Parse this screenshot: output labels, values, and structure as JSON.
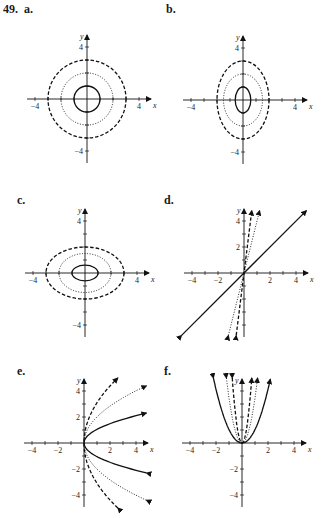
{
  "problem_number": "49.",
  "panels": [
    {
      "id": "a",
      "label": "a.",
      "origin": [
        87,
        99
      ],
      "unit": 13,
      "type": "circles"
    },
    {
      "id": "b",
      "label": "b.",
      "origin": [
        243,
        100
      ],
      "unit": 13,
      "type": "vertical-ellipses"
    },
    {
      "id": "c",
      "label": "c.",
      "origin": [
        85,
        273
      ],
      "unit": 13,
      "type": "horizontal-ellipses"
    },
    {
      "id": "d",
      "label": "d.",
      "origin": [
        244,
        273
      ],
      "unit": 13,
      "type": "lines"
    },
    {
      "id": "e",
      "label": "e.",
      "origin": [
        84,
        443
      ],
      "unit": 13,
      "type": "sideways-parabolas"
    },
    {
      "id": "f",
      "label": "f.",
      "origin": [
        242,
        443
      ],
      "unit": 13,
      "type": "upward-parabolas"
    }
  ],
  "axis": {
    "x_label": "x",
    "y_label": "y"
  },
  "chart_data": [
    {
      "panel": "a",
      "type": "line",
      "title": "a.",
      "xlabel": "x",
      "ylabel": "y",
      "xticks": [
        -4,
        4
      ],
      "yticks": [
        4,
        -4
      ],
      "xlim": [
        -5,
        5
      ],
      "ylim": [
        -5,
        5
      ],
      "series": [
        {
          "name": "solid circle",
          "style": "solid",
          "shape": "circle",
          "center": [
            0,
            0
          ],
          "radius": 1
        },
        {
          "name": "dotted circle",
          "style": "dotted",
          "shape": "circle",
          "center": [
            0,
            0
          ],
          "radius": 2
        },
        {
          "name": "dashed circle",
          "style": "dashed",
          "shape": "circle",
          "center": [
            0,
            0
          ],
          "radius": 3
        }
      ]
    },
    {
      "panel": "b",
      "type": "line",
      "title": "b.",
      "xlabel": "x",
      "ylabel": "y",
      "xticks": [
        -4,
        4
      ],
      "yticks": [
        4,
        -4
      ],
      "xlim": [
        -5,
        5
      ],
      "ylim": [
        -5,
        5
      ],
      "series": [
        {
          "name": "solid ellipse",
          "style": "solid",
          "shape": "ellipse",
          "rx": 0.6,
          "ry": 1
        },
        {
          "name": "dotted ellipse",
          "style": "dotted",
          "shape": "ellipse",
          "rx": 1.5,
          "ry": 2
        },
        {
          "name": "dashed ellipse",
          "style": "dashed",
          "shape": "ellipse",
          "rx": 2,
          "ry": 3
        }
      ]
    },
    {
      "panel": "c",
      "type": "line",
      "title": "c.",
      "xlabel": "x",
      "ylabel": "y",
      "xticks": [
        -4,
        4
      ],
      "yticks": [
        4,
        -4
      ],
      "xlim": [
        -5,
        5
      ],
      "ylim": [
        -5,
        5
      ],
      "series": [
        {
          "name": "solid ellipse",
          "style": "solid",
          "shape": "ellipse",
          "rx": 1,
          "ry": 0.6
        },
        {
          "name": "dotted ellipse",
          "style": "dotted",
          "shape": "ellipse",
          "rx": 2,
          "ry": 1.5
        },
        {
          "name": "dashed ellipse",
          "style": "dashed",
          "shape": "ellipse",
          "rx": 3,
          "ry": 2
        }
      ]
    },
    {
      "panel": "d",
      "type": "line",
      "title": "d.",
      "xlabel": "x",
      "ylabel": "y",
      "xticks": [
        -4,
        -2,
        2,
        4
      ],
      "yticks": [
        4,
        2
      ],
      "xlim": [
        -5,
        5
      ],
      "ylim": [
        -5,
        5
      ],
      "series": [
        {
          "name": "solid line",
          "style": "solid",
          "slope": 1
        },
        {
          "name": "dotted line",
          "style": "dotted",
          "slope": 4
        },
        {
          "name": "dashed line",
          "style": "dashed",
          "slope": 8
        }
      ]
    },
    {
      "panel": "e",
      "type": "line",
      "title": "e.",
      "xlabel": "x",
      "ylabel": "y",
      "xticks": [
        -4,
        -2,
        2,
        4
      ],
      "yticks": [
        4,
        2,
        -2,
        -4
      ],
      "xlim": [
        -5,
        5
      ],
      "ylim": [
        -5,
        5
      ],
      "series": [
        {
          "name": "solid parabola",
          "style": "solid",
          "equation": "x = y^2 (scaled)",
          "k": 1
        },
        {
          "name": "dotted parabola",
          "style": "dotted",
          "k": 0.25
        },
        {
          "name": "dashed parabola",
          "style": "dashed",
          "k": 0.1
        }
      ]
    },
    {
      "panel": "f",
      "type": "line",
      "title": "f.",
      "xlabel": "x",
      "ylabel": "y",
      "xticks": [
        -4,
        -2,
        2,
        4
      ],
      "yticks": [
        -2,
        -4
      ],
      "xlim": [
        -5,
        5
      ],
      "ylim": [
        -5,
        5
      ],
      "series": [
        {
          "name": "solid parabola",
          "style": "solid",
          "equation": "y = x^2",
          "k": 1
        },
        {
          "name": "dotted parabola",
          "style": "dotted",
          "k": 4
        },
        {
          "name": "dashed parabola",
          "style": "dashed",
          "k": 10
        }
      ]
    }
  ]
}
